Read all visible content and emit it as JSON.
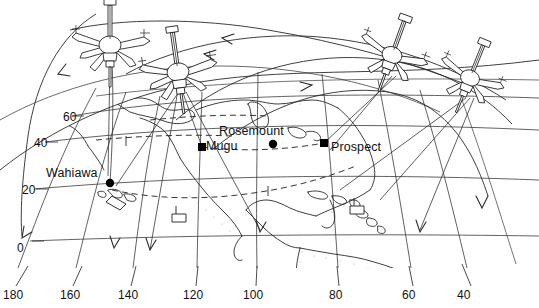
{
  "figure": {
    "kind": "orbital-ground-station-coverage-map",
    "projection": "curved-graticule-globe-segment",
    "line_color": "#1a1a1a",
    "background_color": "#ffffff"
  },
  "axes": {
    "longitude": {
      "label_values": [
        "180",
        "160",
        "140",
        "120",
        "100",
        "80",
        "60",
        "40"
      ],
      "label_x": [
        10,
        67,
        125,
        190,
        250,
        332,
        405,
        460
      ],
      "label_y": 294,
      "tick_top_y": 268,
      "tick_bottom_y": 284
    },
    "latitude": {
      "label_values": [
        "60",
        "40",
        "20",
        "0"
      ],
      "label_x": [
        63,
        34,
        22,
        18
      ],
      "label_y": [
        110,
        136,
        183,
        242
      ]
    }
  },
  "stations": [
    {
      "name": "Wahiawa",
      "label_x": 46,
      "label_y": 166,
      "marker_x": 110,
      "marker_y": 183
    },
    {
      "name": "Mugu",
      "label_x": 205,
      "label_y": 140,
      "marker_x": 202,
      "marker_y": 147
    },
    {
      "name": "Rosemount",
      "label_x": 218,
      "label_y": 124,
      "marker_x": 273,
      "marker_y": 144
    },
    {
      "name": "Prospect",
      "label_x": 330,
      "label_y": 142,
      "marker_x": 324,
      "marker_y": 143
    }
  ],
  "satellites": [
    {
      "id": "satellite-1",
      "x": 110,
      "y": 45,
      "rotation": 0,
      "scale": 1.0
    },
    {
      "id": "satellite-2",
      "x": 178,
      "y": 72,
      "rotation": -8,
      "scale": 1.0
    },
    {
      "id": "satellite-3",
      "x": 392,
      "y": 55,
      "rotation": 20,
      "scale": 0.92
    },
    {
      "id": "satellite-4",
      "x": 470,
      "y": 78,
      "rotation": 22,
      "scale": 0.88
    }
  ],
  "orbit_arcs": {
    "count": 5,
    "arrow_directions": [
      "left",
      "left",
      "right",
      "right",
      "down"
    ]
  },
  "link_lines": {
    "style": "dashed",
    "description": "dashed station-to-station ground links"
  }
}
